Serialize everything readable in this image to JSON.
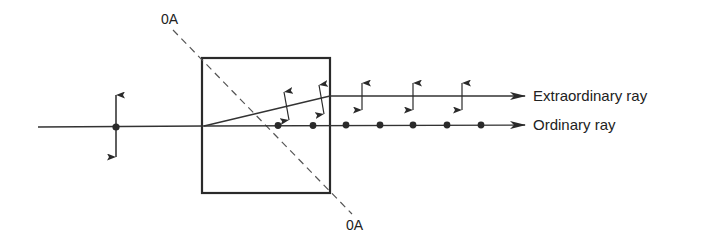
{
  "diagram": {
    "labels": {
      "optic_axis_top": "0A",
      "optic_axis_bottom": "0A",
      "extraordinary": "Extraordinary ray",
      "ordinary": "Ordinary ray"
    },
    "colors": {
      "stroke": "#2a2a2a",
      "background": "#ffffff"
    },
    "crystal": {
      "x": 202,
      "y": 58,
      "width": 128,
      "height": 135
    },
    "incident_ray": {
      "x1": 38,
      "y1": 127,
      "x2": 204,
      "y2": 126
    },
    "incident_polarization": {
      "x": 116,
      "y": 127,
      "arrow_top": 92,
      "arrow_bottom": 160
    },
    "optic_axis_line": {
      "x1": 173,
      "y1": 30,
      "x2": 352,
      "y2": 214
    },
    "extraordinary_ray": {
      "inside": {
        "x1": 204,
        "y1": 126,
        "x2": 330,
        "y2": 96
      },
      "outside": {
        "x1": 330,
        "y1": 96,
        "x2": 525,
        "y2": 96
      },
      "polarization_arrows_x": [
        286,
        321,
        362,
        413,
        462
      ]
    },
    "ordinary_ray": {
      "line": {
        "x1": 204,
        "y1": 126,
        "x2": 525,
        "y2": 125
      },
      "polarization_dots_x": [
        278,
        313,
        346,
        380,
        413,
        447,
        481
      ]
    }
  }
}
